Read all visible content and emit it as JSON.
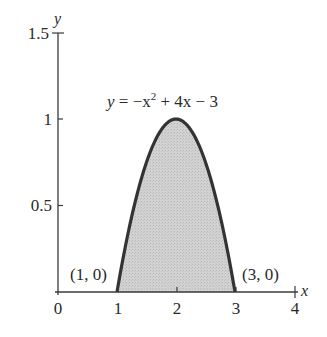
{
  "chart_data": {
    "type": "area",
    "title": "",
    "xlabel": "x",
    "ylabel": "y",
    "xlim": [
      0,
      4
    ],
    "ylim": [
      0,
      1.5
    ],
    "x_ticks": [
      "0",
      "1",
      "2",
      "3",
      "4"
    ],
    "y_ticks": [
      "0.5",
      "1",
      "1.5"
    ],
    "grid": false,
    "legend": null,
    "series": [
      {
        "name": "y = −x² + 4x − 3",
        "function": "-x^2 + 4x - 3",
        "domain": [
          1,
          3
        ],
        "x": [
          1,
          1.25,
          1.5,
          1.75,
          2,
          2.25,
          2.5,
          2.75,
          3
        ],
        "values": [
          0,
          0.4375,
          0.75,
          0.9375,
          1,
          0.9375,
          0.75,
          0.4375,
          0
        ],
        "shaded": true
      }
    ],
    "annotations": [
      {
        "text": "y = −x² + 4x − 3",
        "x": 2.1,
        "y": 1.1
      },
      {
        "text": "(1, 0)",
        "x": 1,
        "y": 0
      },
      {
        "text": "(3, 0)",
        "x": 3,
        "y": 0
      }
    ]
  },
  "labels": {
    "x_axis": "x",
    "y_axis": "y",
    "x_tick_0": "0",
    "x_tick_1": "1",
    "x_tick_2": "2",
    "x_tick_3": "3",
    "x_tick_4": "4",
    "y_tick_05": "0.5",
    "y_tick_1": "1",
    "y_tick_15": "1.5",
    "eq_y": "y",
    "eq_rest": " = −x",
    "eq_exp": "2",
    "eq_tail": " + 4x − 3",
    "point_left": "(1, 0)",
    "point_right": "(3, 0)"
  },
  "colors": {
    "fill": "#cfcfcf",
    "curve": "#333333",
    "axis": "#3a3a3a"
  }
}
